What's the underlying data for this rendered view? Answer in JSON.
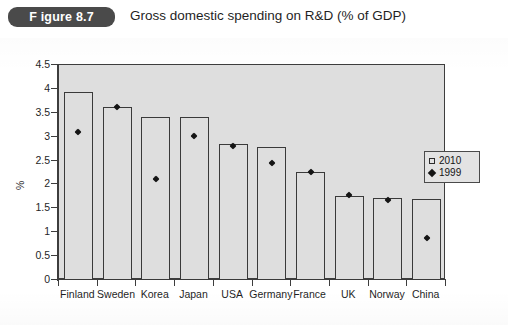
{
  "header": {
    "badge_label": "F igure 8.7",
    "title": "Gross domestic spending on R&D (% of GDP)"
  },
  "legend": {
    "position": "right-middle",
    "entries": [
      {
        "label": "2010",
        "marker": "open-square"
      },
      {
        "label": "1999",
        "marker": "filled-diamond"
      }
    ]
  },
  "chart_data": {
    "type": "bar",
    "title": "Gross domestic spending on R&D (% of GDP)",
    "xlabel": "",
    "ylabel": "%",
    "ylim": [
      0,
      4.5
    ],
    "yticks": [
      "0",
      "0.5",
      "1",
      "1.5",
      "2",
      "2.5",
      "3",
      "3.5",
      "4",
      "4.5"
    ],
    "ytick_values": [
      0,
      0.5,
      1,
      1.5,
      2,
      2.5,
      3,
      3.5,
      4,
      4.5
    ],
    "grid": false,
    "categories": [
      "Finland",
      "Sweden",
      "Korea",
      "Japan",
      "USA",
      "Germany",
      "France",
      "UK",
      "Norway",
      "China"
    ],
    "series": [
      {
        "name": "2010",
        "style": "bar",
        "values": [
          3.93,
          3.62,
          3.42,
          3.42,
          2.84,
          2.78,
          2.27,
          1.76,
          1.72,
          1.7
        ]
      },
      {
        "name": "1999",
        "style": "point-diamond",
        "values": [
          3.1,
          3.62,
          2.12,
          3.02,
          2.8,
          2.45,
          2.27,
          1.78,
          1.68,
          0.88
        ]
      }
    ]
  }
}
